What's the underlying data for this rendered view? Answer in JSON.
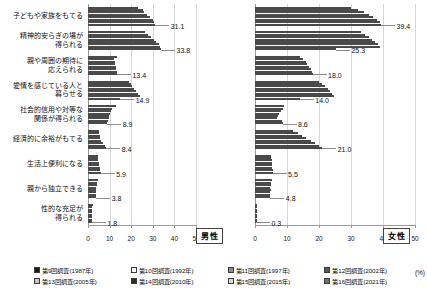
{
  "chart_data": {
    "type": "bar",
    "title": "",
    "orientation": "horizontal",
    "grid": true,
    "legend_position": "bottom",
    "xlabel": "(%)",
    "ylabel": "",
    "unit": "(%)",
    "xlim": [
      0,
      50
    ],
    "xticks": [
      0,
      10,
      20,
      30,
      40,
      50
    ],
    "categories": [
      "子どもや家族をもてる",
      "精神的安らぎの場が\n得られる",
      "親や周囲の期待に\n応えられる",
      "愛情を感じている人と\n暮らせる",
      "社会的信用や対等な\n関係が得られる",
      "経済的に余裕がもてる",
      "生活上便利になる",
      "親から独立できる",
      "性的な充足が\n得られる"
    ],
    "panels": [
      {
        "id": "male",
        "label": "男性",
        "series": [
          {
            "name": "第9回調査(1987年)",
            "color": "#1c1c1c",
            "values": [
              23.3,
              26.2,
              13.3,
              18.8,
              12.8,
              5.2,
              4.4,
              4.7,
              2.3
            ]
          },
          {
            "name": "第10回調査(1992年)",
            "color": "#ffffff",
            "values": [
              25.4,
              27.8,
              12.0,
              19.8,
              11.0,
              5.1,
              4.6,
              4.2,
              2.0
            ]
          },
          {
            "name": "第11回調査(1997年)",
            "color": "#8e8e8e",
            "values": [
              26.1,
              29.0,
              12.5,
              20.5,
              10.7,
              5.6,
              4.7,
              4.0,
              2.0
            ]
          },
          {
            "name": "第12回調査(2002年)",
            "color": "#5a5a5a",
            "values": [
              27.2,
              30.5,
              12.4,
              21.4,
              10.2,
              5.5,
              4.9,
              3.9,
              1.9
            ]
          },
          {
            "name": "第13回調査(2005年)",
            "color": "#c6c6c6",
            "values": [
              28.6,
              31.6,
              12.8,
              22.3,
              9.8,
              6.0,
              5.2,
              3.8,
              1.9
            ]
          },
          {
            "name": "第14回調査(2010年)",
            "color": "#2d2d2d",
            "values": [
              30.0,
              33.0,
              13.0,
              23.3,
              9.5,
              7.0,
              5.5,
              3.7,
              1.8
            ]
          },
          {
            "name": "第15回調査(2015年)",
            "color": "#d9d9d9",
            "values": [
              30.6,
              33.5,
              13.2,
              24.0,
              9.2,
              7.8,
              5.7,
              3.8,
              1.8
            ]
          },
          {
            "name": "第16回調査(2021年)",
            "color": "#707070",
            "values": [
              31.1,
              33.8,
              13.4,
              14.9,
              8.9,
              8.4,
              5.9,
              3.8,
              1.8
            ]
          }
        ],
        "value_labels": [
          {
            "category_index": 0,
            "value": 31.1,
            "text": "31.1"
          },
          {
            "category_index": 1,
            "value": 33.8,
            "text": "33.8"
          },
          {
            "category_index": 2,
            "value": 13.4,
            "text": "13.4"
          },
          {
            "category_index": 3,
            "value": 14.9,
            "text": "14.9"
          },
          {
            "category_index": 4,
            "value": 8.9,
            "text": "8.9"
          },
          {
            "category_index": 5,
            "value": 8.4,
            "text": "8.4"
          },
          {
            "category_index": 6,
            "value": 5.9,
            "text": "5.9"
          },
          {
            "category_index": 7,
            "value": 3.8,
            "text": "3.8"
          },
          {
            "category_index": 8,
            "value": 1.8,
            "text": "1.8"
          }
        ]
      },
      {
        "id": "female",
        "label": "女性",
        "series": [
          {
            "name": "第9回調査(1987年)",
            "color": "#1c1c1c",
            "values": [
              30.1,
              33.0,
              14.0,
              20.0,
              9.0,
              12.0,
              5.0,
              5.2,
              0.5
            ]
          },
          {
            "name": "第10回調査(1992年)",
            "color": "#ffffff",
            "values": [
              32.3,
              34.3,
              15.0,
              21.0,
              8.6,
              13.4,
              5.1,
              5.0,
              0.4
            ]
          },
          {
            "name": "第11回調査(1997年)",
            "color": "#8e8e8e",
            "values": [
              34.0,
              35.5,
              15.8,
              22.0,
              8.0,
              14.6,
              5.2,
              4.9,
              0.4
            ]
          },
          {
            "name": "第12回調査(2002年)",
            "color": "#5a5a5a",
            "values": [
              35.5,
              36.5,
              16.4,
              22.8,
              7.6,
              16.0,
              5.3,
              4.8,
              0.4
            ]
          },
          {
            "name": "第13回調査(2005年)",
            "color": "#c6c6c6",
            "values": [
              37.0,
              37.5,
              17.0,
              23.5,
              7.2,
              17.4,
              5.4,
              4.9,
              0.3
            ]
          },
          {
            "name": "第14回調査(2010年)",
            "color": "#2d2d2d",
            "values": [
              38.2,
              38.5,
              17.5,
              24.2,
              7.0,
              18.8,
              5.4,
              4.8,
              0.3
            ]
          },
          {
            "name": "第15回調査(2015年)",
            "color": "#d9d9d9",
            "values": [
              39.0,
              39.0,
              17.8,
              24.8,
              8.3,
              20.0,
              5.5,
              4.8,
              0.3
            ]
          },
          {
            "name": "第16回調査(2021年)",
            "color": "#707070",
            "values": [
              39.4,
              25.3,
              18.0,
              14.0,
              8.6,
              21.0,
              5.5,
              4.8,
              0.3
            ]
          }
        ],
        "value_labels": [
          {
            "category_index": 0,
            "value": 39.4,
            "text": "39.4"
          },
          {
            "category_index": 1,
            "value": 25.3,
            "text": "25.3"
          },
          {
            "category_index": 2,
            "value": 18.0,
            "text": "18.0"
          },
          {
            "category_index": 3,
            "value": 14.0,
            "text": "14.0"
          },
          {
            "category_index": 4,
            "value": 8.6,
            "text": "8.6"
          },
          {
            "category_index": 5,
            "value": 21.0,
            "text": "21.0"
          },
          {
            "category_index": 6,
            "value": 5.5,
            "text": "5.5"
          },
          {
            "category_index": 7,
            "value": 4.8,
            "text": "4.8"
          },
          {
            "category_index": 8,
            "value": 0.3,
            "text": "0.3"
          }
        ]
      }
    ],
    "legend": [
      {
        "label": "第9回調査(1987年)",
        "color": "#1c1c1c"
      },
      {
        "label": "第10回調査(1992年)",
        "color": "#ffffff"
      },
      {
        "label": "第11回調査(1997年)",
        "color": "#8e8e8e"
      },
      {
        "label": "第12回調査(2002年)",
        "color": "#5a5a5a"
      },
      {
        "label": "第13回調査(2005年)",
        "color": "#c6c6c6"
      },
      {
        "label": "第14回調査(2010年)",
        "color": "#2d2d2d"
      },
      {
        "label": "第15回調査(2015年)",
        "color": "#d9d9d9"
      },
      {
        "label": "第16回調査(2021年)",
        "color": "#707070"
      }
    ]
  }
}
